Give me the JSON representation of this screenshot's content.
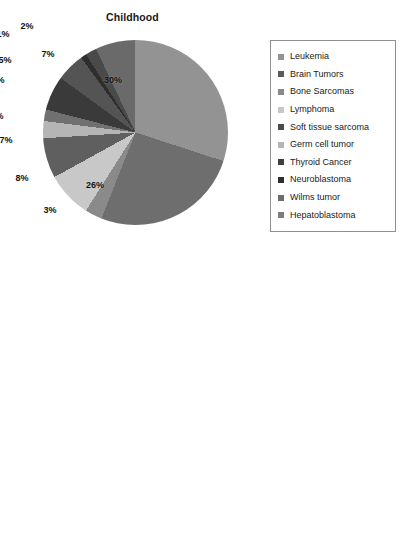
{
  "chart_data": [
    {
      "type": "pie",
      "id": "childhood",
      "title": "Childhood",
      "unit": "%",
      "grid": false,
      "legend_position": "right",
      "categories": [
        "Leukemia",
        "Brain Tumors",
        "Bone Sarcomas",
        "Lymphoma",
        "Soft tissue sarcoma",
        "Germ cell tumor",
        "Thyroid Cancer",
        "Neuroblastoma",
        "Wilms tumor",
        "Hepatoblastoma"
      ],
      "values": [
        30,
        26,
        3,
        8,
        7,
        3,
        2,
        6,
        5,
        1
      ],
      "extra_values": [
        2,
        7
      ],
      "labels": [
        "30%",
        "26%",
        "3%",
        "8%",
        "7%",
        "3%",
        "2%",
        "6%",
        "5%",
        "1%",
        "2%",
        "7%"
      ],
      "colors": [
        "#939393",
        "#6e6e6e",
        "#8a8a8a",
        "#c8c8c8",
        "#5a5a5a",
        "#b5b5b5",
        "#707070",
        "#3a3a3a",
        "#4a4a4a",
        "#2e2e2e",
        "#4e4e4e",
        "#6a6a6a"
      ],
      "slices": [
        {
          "label": "Leukemia",
          "value": 30,
          "display": "30%",
          "color": "#939393"
        },
        {
          "label": "Brain Tumors",
          "value": 26,
          "display": "26%",
          "color": "#6e6e6e"
        },
        {
          "label": "Bone Sarcomas",
          "value": 3,
          "display": "3%",
          "color": "#8a8a8a"
        },
        {
          "label": "Lymphoma",
          "value": 8,
          "display": "8%",
          "color": "#c8c8c8"
        },
        {
          "label": "Soft tissue sarcoma",
          "value": 7,
          "display": "7%",
          "color": "#5f5f5f"
        },
        {
          "label": "Germ cell tumor",
          "value": 3,
          "display": "3%",
          "color": "#b5b5b5"
        },
        {
          "label": "Thyroid Cancer",
          "value": 2,
          "display": "2%",
          "color": "#707070"
        },
        {
          "label": "Neuroblastoma",
          "value": 6,
          "display": "6%",
          "color": "#3a3a3a"
        },
        {
          "label": "Wilms tumor",
          "value": 5,
          "display": "5%",
          "color": "#545454"
        },
        {
          "label": "Hepatoblastoma",
          "value": 1,
          "display": "1%",
          "color": "#2e2e2e"
        },
        {
          "label": "",
          "value": 2,
          "display": "2%",
          "color": "#4a4a4a"
        },
        {
          "label": "",
          "value": 7,
          "display": "7%",
          "color": "#6a6a6a"
        }
      ]
    },
    {
      "type": "pie",
      "id": "aya",
      "title": "Adolescents & Young Adults",
      "unit": "%",
      "grid": false,
      "legend_position": "right",
      "categories": [
        "Leukemia",
        "Brain Tumors",
        "Bone Sarcomas",
        "Lymphoma",
        "Soft tissue sarcoma",
        "Germ cell tumors",
        "Thyroid Cancer",
        "Breast Cancer",
        "Colorectal Cancer",
        "Liver Cancers",
        "Cervical Cancer",
        "Melanoma",
        "Other"
      ],
      "values": [
        6,
        6,
        3,
        20,
        8,
        15,
        11,
        5,
        1,
        1,
        8,
        11,
        5
      ],
      "labels": [
        "6%",
        "6%",
        "3%",
        "20%",
        "8%",
        "15%",
        "11%",
        "5%",
        "1%",
        "1%",
        "8%",
        "11%",
        "5%"
      ],
      "colors": [
        "#a8a8a8",
        "#6a6a6a",
        "#8e8e8e",
        "#c4c4c4",
        "#7a7a7a",
        "#bdbdbd",
        "#666666",
        "#3f3f3f",
        "#5c5c5c",
        "#8f8f8f",
        "#2c2c2c",
        "#565656",
        "#cccccc"
      ],
      "slices": [
        {
          "label": "Leukemia",
          "value": 6,
          "display": "6%",
          "color": "#a8a8a8"
        },
        {
          "label": "Brain Tumors",
          "value": 6,
          "display": "6%",
          "color": "#6a6a6a"
        },
        {
          "label": "Bone Sarcomas",
          "value": 3,
          "display": "3%",
          "color": "#8e8e8e"
        },
        {
          "label": "Lymphoma",
          "value": 20,
          "display": "20%",
          "color": "#c4c4c4"
        },
        {
          "label": "Soft tissue sarcoma",
          "value": 8,
          "display": "8%",
          "color": "#6f6f6f"
        },
        {
          "label": "Germ cell tumors",
          "value": 15,
          "display": "15%",
          "color": "#bdbdbd"
        },
        {
          "label": "Thyroid Cancer",
          "value": 11,
          "display": "11%",
          "color": "#5e5e5e"
        },
        {
          "label": "Breast Cancer",
          "value": 5,
          "display": "5%",
          "color": "#3a3a3a"
        },
        {
          "label": "Colorectal Cancer",
          "value": 1,
          "display": "1%",
          "color": "#5c5c5c"
        },
        {
          "label": "Liver Cancers",
          "value": 1,
          "display": "1%",
          "color": "#8f8f8f"
        },
        {
          "label": "Cervical Cancer",
          "value": 8,
          "display": "8%",
          "color": "#262626"
        },
        {
          "label": "Melanoma",
          "value": 11,
          "display": "11%",
          "color": "#565656"
        },
        {
          "label": "Other",
          "value": 5,
          "display": "5%",
          "color": "#cccccc"
        }
      ]
    }
  ],
  "childhood": {
    "title": "Childhood",
    "slice_labels": [
      {
        "text": "30%",
        "x": 70,
        "y": 40
      },
      {
        "text": "26%",
        "x": 52,
        "y": 145
      },
      {
        "text": "3%",
        "x": 7,
        "y": 170
      },
      {
        "text": "8%",
        "x": -21,
        "y": 138
      },
      {
        "text": "7%",
        "x": -37,
        "y": 100
      },
      {
        "text": "3%",
        "x": -46,
        "y": 76
      },
      {
        "text": "2%",
        "x": -63,
        "y": 56
      },
      {
        "text": "6%",
        "x": -45,
        "y": 40
      },
      {
        "text": "5%",
        "x": -38,
        "y": 20
      },
      {
        "text": "1%",
        "x": -40,
        "y": -6
      },
      {
        "text": "2%",
        "x": -16,
        "y": -14
      },
      {
        "text": "7%",
        "x": 5,
        "y": 14
      }
    ],
    "legend": [
      {
        "label": "Leukemia",
        "color": "#939393"
      },
      {
        "label": "Brain Tumors",
        "color": "#5a5a5a"
      },
      {
        "label": "Bone Sarcomas",
        "color": "#8a8a8a"
      },
      {
        "label": "Lymphoma",
        "color": "#c8c8c8"
      },
      {
        "label": "Soft tissue sarcoma",
        "color": "#4a4a4a"
      },
      {
        "label": "Germ cell tumor",
        "color": "#b5b5b5"
      },
      {
        "label": "Thyroid Cancer",
        "color": "#3f3f3f"
      },
      {
        "label": "Neuroblastoma",
        "color": "#2e2e2e"
      },
      {
        "label": "Wilms tumor",
        "color": "#6e6e6e"
      },
      {
        "label": "Hepatoblastoma",
        "color": "#7d7d7d"
      }
    ]
  },
  "aya": {
    "title": "Adolescents & Young Adults",
    "slice_labels": [
      {
        "text": "6%",
        "x": 13,
        "y": -2
      },
      {
        "text": "6%",
        "x": 44,
        "y": 6
      },
      {
        "text": "3%",
        "x": 87,
        "y": 10
      },
      {
        "text": "20%",
        "x": 68,
        "y": 80
      },
      {
        "text": "8%",
        "x": 50,
        "y": 143
      },
      {
        "text": "15%",
        "x": 8,
        "y": 166
      },
      {
        "text": "11%",
        "x": -40,
        "y": 138
      },
      {
        "text": "5%",
        "x": -52,
        "y": 102
      },
      {
        "text": "1%",
        "x": -73,
        "y": 77
      },
      {
        "text": "1%",
        "x": -101,
        "y": 88
      },
      {
        "text": "8%",
        "x": -71,
        "y": 52
      },
      {
        "text": "11%",
        "x": -40,
        "y": 12
      },
      {
        "text": "5%",
        "x": -12,
        "y": -4
      }
    ],
    "legend": [
      {
        "label": "Leukemia",
        "color": "#a8a8a8"
      },
      {
        "label": "Brain Tumors",
        "color": "#4a4a4a"
      },
      {
        "label": "Bone Sarcomas",
        "color": "#8e8e8e"
      },
      {
        "label": "Lymphoma",
        "color": "#c4c4c4"
      },
      {
        "label": "Soft tissue sarcoma",
        "color": "#3d3d3d"
      },
      {
        "label": "Germ cell tumors",
        "color": "#bdbdbd"
      },
      {
        "label": "Thyroid Cancer",
        "color": "#4f4f4f"
      },
      {
        "label": "Breast Cancer",
        "color": "#2f2f2f"
      },
      {
        "label": "Colorectal Cancer",
        "color": "#3a3a3a"
      },
      {
        "label": "Liver Cancers",
        "color": "#8f8f8f"
      },
      {
        "label": "Cervical Cancer",
        "color": "#262626"
      },
      {
        "label": "Melanoma",
        "color": "#565656"
      },
      {
        "label": "Other",
        "color": "#b0b0b0"
      }
    ]
  }
}
